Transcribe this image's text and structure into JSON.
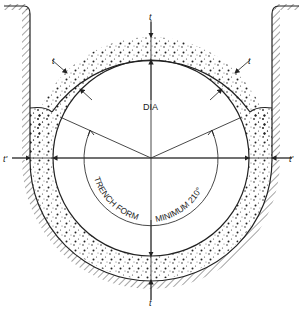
{
  "diagram": {
    "title_labels": {
      "diameter": "DIA",
      "trench_form": "TRENCH FORM",
      "minimum_angle": "MINIMUM 210°",
      "thickness": "t",
      "thickness_top": "t",
      "thickness_bottom": "t",
      "thickness_upper_left": "t",
      "thickness_upper_right": "t",
      "side_thickness_left": "t'",
      "side_thickness_right": "t'"
    },
    "colors": {
      "line": "#2a2a2a",
      "fill_dots": "#333333",
      "background": "#ffffff"
    }
  }
}
